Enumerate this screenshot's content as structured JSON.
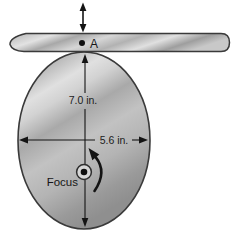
{
  "figure": {
    "labels": {
      "point_a": "A",
      "vertical_dimension": "7.0 in.",
      "horizontal_dimension": "5.6 in.",
      "focus": "Focus"
    },
    "dimensions": {
      "vertical_value": "7.0",
      "horizontal_value": "5.6",
      "unit": "in."
    },
    "colors": {
      "background": "#ffffff",
      "outline": "#3a3a3a",
      "line_arrow": "#141414",
      "metal_light": "#e2e2e2",
      "metal_dark": "#989898"
    },
    "icons": {
      "oscillation_arrow": "double-headed-vertical-arrow",
      "rotation_arrow": "counterclockwise-arc-arrow"
    }
  }
}
